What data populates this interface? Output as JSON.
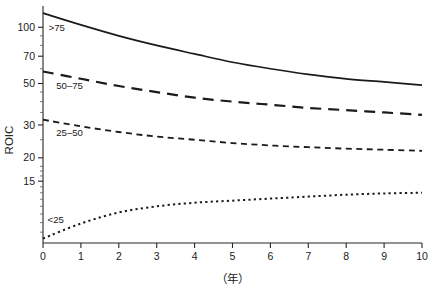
{
  "chart_data": {
    "type": "line",
    "title": "",
    "subtitle": "",
    "xlabel": "（年）",
    "ylabel": "ROIC",
    "yscale": "log",
    "ylim": [
      7,
      130
    ],
    "xlim": [
      0,
      10
    ],
    "grid": false,
    "legend_position": "inline-left",
    "x_ticks": [
      "0",
      "1",
      "2",
      "3",
      "4",
      "5",
      "6",
      "7",
      "8",
      "9",
      "10"
    ],
    "y_ticks": [
      "100",
      "70",
      "50",
      "30",
      "20",
      "15"
    ],
    "y_tick_values": [
      100,
      70,
      50,
      30,
      20,
      15
    ],
    "y_minor_ticks": [
      90,
      80,
      60,
      45,
      40,
      35,
      25,
      18,
      17,
      16,
      14,
      13,
      12,
      11,
      10,
      9,
      8
    ],
    "x": [
      0,
      1,
      2,
      3,
      4,
      5,
      6,
      7,
      8,
      9,
      10
    ],
    "series": [
      {
        "name": ">75",
        "label": ">75",
        "style": "solid",
        "color": "#1a1a1a",
        "values": [
          119,
          103,
          90,
          80,
          72,
          65,
          60,
          56,
          53,
          51,
          49
        ]
      },
      {
        "name": "50–75",
        "label": "50–75",
        "style": "long-dash",
        "color": "#1a1a1a",
        "values": [
          58,
          53,
          48.5,
          45,
          42,
          40,
          38.5,
          37,
          36,
          35,
          34
        ]
      },
      {
        "name": "25–50",
        "label": "25–50",
        "style": "short-dash",
        "color": "#1a1a1a",
        "values": [
          32,
          29.5,
          27.5,
          26,
          25,
          24,
          23.3,
          22.8,
          22.4,
          22.1,
          21.8
        ]
      },
      {
        "name": "<25",
        "label": "<25",
        "style": "dotted",
        "color": "#1a1a1a",
        "values": [
          7.4,
          8.9,
          10.2,
          11.0,
          11.5,
          11.8,
          12.1,
          12.4,
          12.7,
          12.9,
          13.0
        ]
      }
    ],
    "annotations": [
      {
        "text": ">75",
        "x": 0.15,
        "y": 100
      },
      {
        "text": "50–75",
        "x": 0.35,
        "y": 49
      },
      {
        "text": "25–50",
        "x": 0.35,
        "y": 27.5
      },
      {
        "text": "<25",
        "x": 0.12,
        "y": 9.4
      }
    ]
  },
  "axes": {
    "y_title": "ROIC",
    "x_title": "（年）"
  },
  "ticks": {
    "y": [
      "100",
      "70",
      "50",
      "30",
      "20",
      "15"
    ],
    "x": [
      "0",
      "1",
      "2",
      "3",
      "4",
      "5",
      "6",
      "7",
      "8",
      "9",
      "10"
    ]
  },
  "labels": {
    "s0": ">75",
    "s1": "50–75",
    "s2": "25–50",
    "s3": "<25"
  }
}
